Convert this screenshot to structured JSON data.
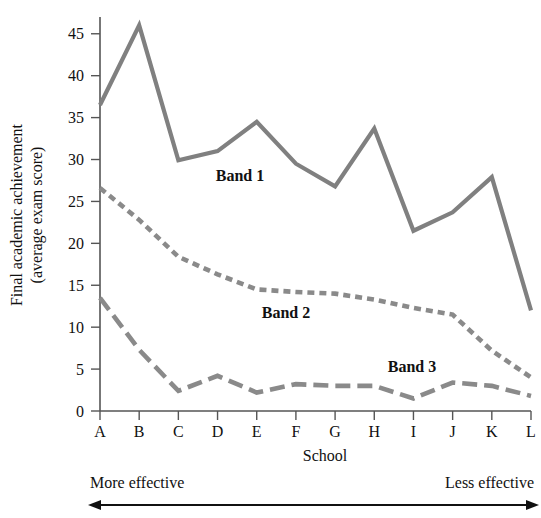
{
  "chart_data": {
    "type": "line",
    "title": "",
    "xlabel": "School",
    "ylabel": "Final academic achievement (average exam score)",
    "ylabel_line1": "Final academic achievement",
    "ylabel_line2": "(average exam score)",
    "categories": [
      "A",
      "B",
      "C",
      "D",
      "E",
      "F",
      "G",
      "H",
      "I",
      "J",
      "K",
      "L"
    ],
    "ylim": [
      0,
      47
    ],
    "yticks": [
      0,
      5,
      10,
      15,
      20,
      25,
      30,
      35,
      40,
      45
    ],
    "ytick_labels": [
      "0",
      "5",
      "10",
      "15",
      "20",
      "25",
      "30",
      "35",
      "40",
      "45"
    ],
    "grid": false,
    "legend_position": "inline-annotations",
    "series": [
      {
        "name": "Band 1",
        "style": "solid",
        "color": "#808080",
        "label_text": "Band 1",
        "values": [
          36.5,
          46.0,
          29.9,
          31.0,
          34.5,
          29.5,
          26.8,
          33.7,
          21.5,
          23.7,
          27.9,
          12.0
        ]
      },
      {
        "name": "Band 2",
        "style": "short-dashed",
        "color": "#8a8a8a",
        "label_text": "Band 2",
        "values": [
          26.6,
          22.8,
          18.4,
          16.3,
          14.5,
          14.2,
          14.0,
          13.3,
          12.3,
          11.5,
          7.2,
          4.0
        ]
      },
      {
        "name": "Band 3",
        "style": "long-dashed",
        "color": "#8a8a8a",
        "label_text": "Band 3",
        "values": [
          13.5,
          7.3,
          2.4,
          4.2,
          2.2,
          3.2,
          3.0,
          3.0,
          1.5,
          3.4,
          3.0,
          1.8
        ]
      }
    ],
    "annotations": [
      {
        "id": "more-effective",
        "text": "More effective"
      },
      {
        "id": "less-effective",
        "text": "Less effective"
      },
      {
        "id": "direction-arrow",
        "text": ""
      }
    ]
  }
}
